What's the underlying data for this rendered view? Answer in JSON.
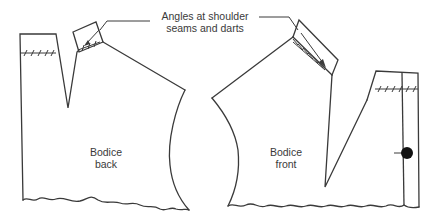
{
  "diagram": {
    "callout": {
      "line1": "Angles at shoulder",
      "line2": "seams and darts"
    },
    "pieces": [
      {
        "id": "back",
        "line1": "Bodice",
        "line2": "back"
      },
      {
        "id": "front",
        "line1": "Bodice",
        "line2": "front"
      }
    ],
    "colors": {
      "stroke": "#3a3a3a",
      "background": "#ffffff",
      "button": "#111111"
    }
  }
}
